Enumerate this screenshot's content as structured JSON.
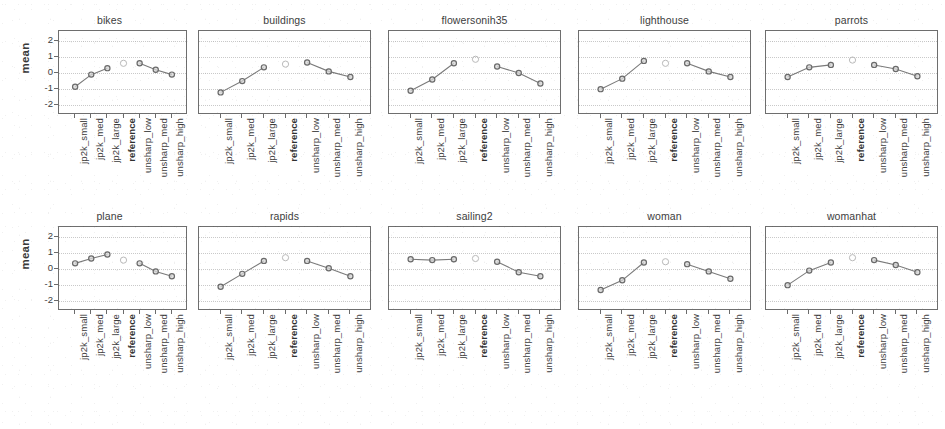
{
  "figure": {
    "type": "trellis-small-multiples",
    "ylabel": "mean",
    "y_ticks": [
      "2",
      "1",
      "0",
      "-1",
      "-2"
    ],
    "ylim": [
      -2.6,
      2.6
    ],
    "x_categories": [
      "jp2k_small",
      "jp2k_med",
      "jp2k_large",
      "reference",
      "unsharp_low",
      "unsharp_med",
      "unsharp_high"
    ],
    "highlight_category": "reference",
    "colors": {
      "line": "#7a7a7a",
      "point": "#6a6a6a",
      "axis": "#6e6e6e",
      "grid": "#c9c9c9",
      "text": "#3d3d3d"
    }
  },
  "chart_data": {
    "type": "line",
    "title": "",
    "xlabel": "",
    "ylabel": "mean",
    "ylim": [
      -2.6,
      2.6
    ],
    "yticks": [
      2,
      1,
      0,
      -1,
      -2
    ],
    "grid": true,
    "legend": "none",
    "categories": [
      "jp2k_small",
      "jp2k_med",
      "jp2k_large",
      "reference",
      "unsharp_low",
      "unsharp_med",
      "unsharp_high"
    ],
    "panels": [
      {
        "title": "bikes",
        "row": 0,
        "col": 0,
        "values": [
          -0.85,
          -0.1,
          0.3,
          0.6,
          0.6,
          0.2,
          -0.1
        ]
      },
      {
        "title": "buildings",
        "row": 0,
        "col": 1,
        "values": [
          -1.2,
          -0.5,
          0.35,
          0.55,
          0.65,
          0.1,
          -0.25
        ]
      },
      {
        "title": "flowersonih35",
        "row": 0,
        "col": 2,
        "values": [
          -1.1,
          -0.4,
          0.6,
          0.85,
          0.4,
          0.0,
          -0.65
        ]
      },
      {
        "title": "lighthouse",
        "row": 0,
        "col": 3,
        "values": [
          -1.0,
          -0.35,
          0.75,
          0.6,
          0.6,
          0.1,
          -0.25
        ]
      },
      {
        "title": "parrots",
        "row": 0,
        "col": 4,
        "values": [
          -0.25,
          0.35,
          0.5,
          0.8,
          0.5,
          0.25,
          -0.2
        ]
      },
      {
        "title": "plane",
        "row": 1,
        "col": 0,
        "values": [
          0.35,
          0.65,
          0.9,
          0.55,
          0.35,
          -0.15,
          -0.45
        ]
      },
      {
        "title": "rapids",
        "row": 1,
        "col": 1,
        "values": [
          -1.1,
          -0.3,
          0.5,
          0.7,
          0.5,
          0.05,
          -0.45
        ]
      },
      {
        "title": "sailing2",
        "row": 1,
        "col": 2,
        "values": [
          0.6,
          0.55,
          0.6,
          0.65,
          0.45,
          -0.2,
          -0.45
        ]
      },
      {
        "title": "woman",
        "row": 1,
        "col": 3,
        "values": [
          -1.3,
          -0.7,
          0.4,
          0.45,
          0.3,
          -0.15,
          -0.6
        ]
      },
      {
        "title": "womanhat",
        "row": 1,
        "col": 4,
        "values": [
          -1.0,
          -0.1,
          0.4,
          0.7,
          0.55,
          0.25,
          -0.2
        ]
      }
    ]
  }
}
